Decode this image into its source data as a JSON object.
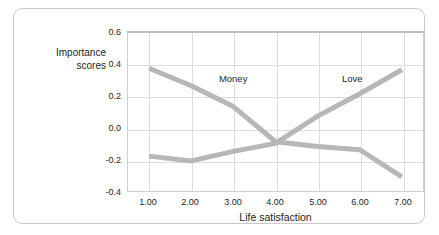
{
  "chart_data": {
    "type": "line",
    "title": "",
    "xlabel": "Life satisfaction",
    "ylabel": "Importance\nscores",
    "x": [
      1.0,
      2.0,
      3.0,
      4.0,
      5.0,
      6.0,
      7.0
    ],
    "xtick_labels": [
      "1.00",
      "2.00",
      "3.00",
      "4.00",
      "5.00",
      "6.00",
      "7.00"
    ],
    "ytick_labels": [
      "0.6",
      "0.4",
      "0.2",
      "0.0",
      "-0.2",
      "-0.4"
    ],
    "yticks": [
      0.6,
      0.4,
      0.2,
      0.0,
      -0.2,
      -0.4
    ],
    "xlim": [
      0.5,
      7.5
    ],
    "ylim": [
      -0.4,
      0.6
    ],
    "grid": true,
    "legend_position": "inline-annotations",
    "series": [
      {
        "name": "Money",
        "values": [
          0.38,
          0.27,
          0.14,
          -0.08,
          -0.11,
          -0.13,
          -0.3
        ],
        "color": "#b7b7b7",
        "label_x": 2.62,
        "label_y": 0.305
      },
      {
        "name": "Love",
        "values": [
          -0.17,
          -0.2,
          -0.14,
          -0.09,
          0.08,
          0.22,
          0.37
        ],
        "color": "#b7b7b7",
        "label_x": 5.52,
        "label_y": 0.305
      }
    ]
  },
  "figure": {
    "y_axis_title": "Importance\nscores",
    "x_axis_title": "Life satisfaction",
    "series_money_label": "Money",
    "series_love_label": "Love",
    "ytick_0": "0.6",
    "ytick_1": "0.4",
    "ytick_2": "0.2",
    "ytick_3": "0.0",
    "ytick_4": "-0.2",
    "ytick_5": "-0.4",
    "xtick_0": "1.00",
    "xtick_1": "2.00",
    "xtick_2": "3.00",
    "xtick_3": "4.00",
    "xtick_4": "5.00",
    "xtick_5": "6.00",
    "xtick_6": "7.00",
    "colors": {
      "line": "#b7b7b7",
      "grid": "#dcdcdc",
      "frame": "#cfcfcf",
      "card_border": "#c9c9c9",
      "text": "#231f20"
    }
  }
}
